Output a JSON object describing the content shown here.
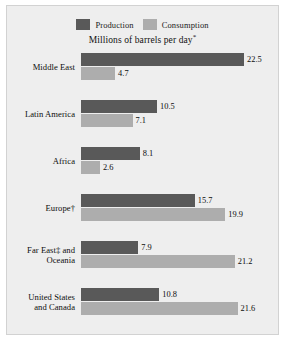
{
  "chart_data": {
    "type": "bar",
    "orientation": "horizontal",
    "title": "",
    "subtitle": "Millions of barrels per day",
    "subtitle_marker": "*",
    "xlabel": "",
    "ylabel": "",
    "xlim": [
      0,
      22.5
    ],
    "grid": false,
    "legend_position": "top-center",
    "categories": [
      "Middle East",
      "Latin America",
      "Africa",
      "Europe†",
      "Far East‡ and Oceania",
      "United States and Canada"
    ],
    "series": [
      {
        "name": "Production",
        "color": "#595959",
        "values": [
          22.5,
          10.5,
          8.1,
          15.7,
          7.9,
          10.8
        ]
      },
      {
        "name": "Consumption",
        "color": "#adadad",
        "values": [
          4.7,
          7.1,
          2.6,
          19.9,
          21.2,
          21.6
        ]
      }
    ],
    "rows": [
      {
        "category": "Middle East",
        "category_line1": "Middle East",
        "category_line2": "",
        "production": 22.5,
        "consumption": 4.7,
        "production_label": "22.5",
        "consumption_label": "4.7"
      },
      {
        "category": "Latin America",
        "category_line1": "Latin America",
        "category_line2": "",
        "production": 10.5,
        "consumption": 7.1,
        "production_label": "10.5",
        "consumption_label": "7.1"
      },
      {
        "category": "Africa",
        "category_line1": "Africa",
        "category_line2": "",
        "production": 8.1,
        "consumption": 2.6,
        "production_label": "8.1",
        "consumption_label": "2.6"
      },
      {
        "category": "Europe†",
        "category_line1": "Europe†",
        "category_line2": "",
        "production": 15.7,
        "consumption": 19.9,
        "production_label": "15.7",
        "consumption_label": "19.9"
      },
      {
        "category": "Far East‡ and Oceania",
        "category_line1": "Far East‡ and",
        "category_line2": "Oceania",
        "production": 7.9,
        "consumption": 21.2,
        "production_label": "7.9",
        "consumption_label": "21.2"
      },
      {
        "category": "United States and Canada",
        "category_line1": "United States",
        "category_line2": "and Canada",
        "production": 10.8,
        "consumption": 21.6,
        "production_label": "10.8",
        "consumption_label": "21.6"
      }
    ]
  },
  "legend": {
    "entries": [
      {
        "label": "Production",
        "color": "#595959"
      },
      {
        "label": "Consumption",
        "color": "#adadad"
      }
    ]
  },
  "colors": {
    "production": "#595959",
    "consumption": "#adadad",
    "panel_background": "#eeeeee",
    "panel_border": "#d2d2d2",
    "page_background": "#ffffff",
    "text": "#0d0d0d"
  }
}
